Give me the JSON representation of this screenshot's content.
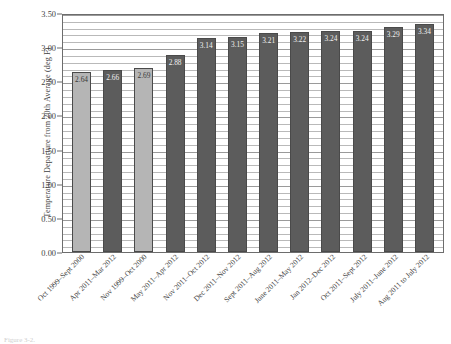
{
  "chart_data": {
    "type": "bar",
    "title": "",
    "subtitle": "",
    "xlabel": "",
    "ylabel": "Temperature Departure from 20th Average (deg F)",
    "ylim": [
      0.0,
      3.5
    ],
    "ytick_labels": [
      "0.00",
      "0.50",
      "1.00",
      "1.50",
      "2.00",
      "2.50",
      "3.00",
      "3.50"
    ],
    "ytick_values": [
      0.0,
      0.5,
      1.0,
      1.5,
      2.0,
      2.5,
      3.0,
      3.5
    ],
    "grid": true,
    "grid_minor_step": 0.1,
    "legend": "none",
    "categories": [
      "Oct 1999–Sept 2000",
      "Apr 2011–Mar 2012",
      "Nov 1999–Oct 2000",
      "May 2011–Apr 2012",
      "Nov 2011–Oct 2012",
      "Dec 2011–Nov 2012",
      "Sept 2011–Aug 2012",
      "June 2011–May 2012",
      "Jan 2012–Dec 2012",
      "Oct 2011–Sept 2012",
      "July 2011–June 2012",
      "Aug 2011 to July 2012"
    ],
    "values": [
      2.64,
      2.66,
      2.69,
      2.88,
      3.14,
      3.15,
      3.21,
      3.22,
      3.24,
      3.24,
      3.29,
      3.34
    ],
    "value_labels": [
      "2.64",
      "2.66",
      "2.69",
      "2.88",
      "3.14",
      "3.15",
      "3.21",
      "3.22",
      "3.24",
      "3.24",
      "3.29",
      "3.34"
    ],
    "bar_colors": [
      "#b5b5b5",
      "#5c5c5c",
      "#b5b5b5",
      "#5c5c5c",
      "#5c5c5c",
      "#5c5c5c",
      "#5c5c5c",
      "#5c5c5c",
      "#5c5c5c",
      "#5c5c5c",
      "#5c5c5c",
      "#5c5c5c"
    ],
    "bar_shades": [
      "light",
      "dark",
      "light",
      "dark",
      "dark",
      "dark",
      "dark",
      "dark",
      "dark",
      "dark",
      "dark",
      "dark"
    ]
  },
  "colors": {
    "light_bar": "#b5b5b5",
    "dark_bar": "#5c5c5c",
    "bar_edge": "#4a4a4a",
    "gridline": "#b9b9b9",
    "axis": "#6d6d6d",
    "text": "#3f3f3f"
  },
  "caption": {
    "text": "Figure 3-2."
  }
}
